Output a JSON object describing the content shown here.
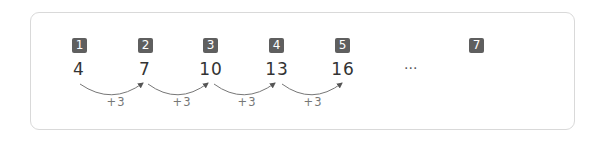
{
  "sequence": {
    "terms": [
      {
        "index": "1",
        "value": "4"
      },
      {
        "index": "2",
        "value": "7"
      },
      {
        "index": "3",
        "value": "10"
      },
      {
        "index": "4",
        "value": "13"
      },
      {
        "index": "5",
        "value": "16"
      }
    ],
    "ellipsis": "···",
    "target_index": "7",
    "step_labels": [
      "+3",
      "+3",
      "+3",
      "+3"
    ]
  },
  "colors": {
    "badge_bg": "#5f5f5f",
    "arc": "#555555",
    "border": "#d9d9d9"
  }
}
